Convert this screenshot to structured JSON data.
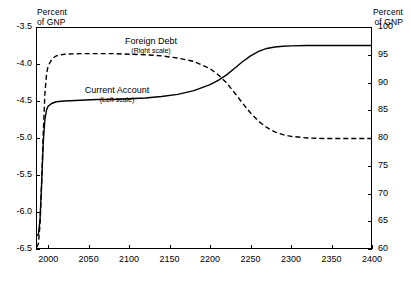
{
  "chart_data": {
    "type": "line",
    "title": "",
    "xlabel": "",
    "xlim": [
      1985,
      2400
    ],
    "grid": false,
    "legend_position": "inline-annotations",
    "xticks": [
      "2000",
      "2050",
      "2100",
      "2150",
      "2200",
      "2250",
      "2300",
      "2350",
      "2400"
    ],
    "xtick_values": [
      2000,
      2050,
      2100,
      2150,
      2200,
      2250,
      2300,
      2350,
      2400
    ],
    "left_axis": {
      "title": "Percent\nof GNP",
      "ylim": [
        -6.5,
        -3.5
      ],
      "ticks": [
        "-3.5",
        "-4.0",
        "-4.5",
        "-5.0",
        "-5.5",
        "-6.0",
        "-6.5"
      ],
      "tick_values": [
        -3.5,
        -4.0,
        -4.5,
        -5.0,
        -5.5,
        -6.0,
        -6.5
      ]
    },
    "right_axis": {
      "title": "Percent\nof GNP",
      "ylim": [
        60,
        100
      ],
      "ticks": [
        "100",
        "95",
        "90",
        "85",
        "80",
        "75",
        "70",
        "65",
        "60"
      ],
      "tick_values": [
        100,
        95,
        90,
        85,
        80,
        75,
        70,
        65,
        60
      ]
    },
    "series": [
      {
        "name": "Current Account",
        "scale_note": "(Left scale)",
        "axis": "left",
        "style": "solid",
        "color": "#000000",
        "x": [
          1986,
          1988,
          1990,
          1992,
          1994,
          1996,
          1998,
          2000,
          2005,
          2010,
          2020,
          2040,
          2060,
          2080,
          2100,
          2120,
          2140,
          2160,
          2180,
          2200,
          2210,
          2220,
          2230,
          2240,
          2250,
          2260,
          2270,
          2280,
          2290,
          2300,
          2320,
          2340,
          2360,
          2380,
          2400
        ],
        "y": [
          -6.32,
          -6.3,
          -6.1,
          -5.6,
          -5.05,
          -4.75,
          -4.62,
          -4.57,
          -4.53,
          -4.51,
          -4.5,
          -4.49,
          -4.48,
          -4.48,
          -4.47,
          -4.46,
          -4.44,
          -4.41,
          -4.36,
          -4.28,
          -4.22,
          -4.15,
          -4.06,
          -3.97,
          -3.89,
          -3.83,
          -3.79,
          -3.77,
          -3.76,
          -3.755,
          -3.75,
          -3.75,
          -3.75,
          -3.75,
          -3.75
        ]
      },
      {
        "name": "Foreign Debt",
        "scale_note": "(Right scale)",
        "axis": "right",
        "style": "dashed",
        "color": "#000000",
        "x": [
          1986,
          1988,
          1990,
          1992,
          1994,
          1996,
          1998,
          2000,
          2005,
          2010,
          2020,
          2040,
          2060,
          2080,
          2100,
          2120,
          2140,
          2160,
          2180,
          2200,
          2210,
          2220,
          2230,
          2240,
          2250,
          2260,
          2270,
          2280,
          2290,
          2300,
          2320,
          2340,
          2360,
          2380,
          2400
        ],
        "y": [
          60.3,
          61.0,
          64.5,
          72.0,
          81.0,
          88.0,
          91.5,
          93.0,
          94.3,
          94.8,
          95.1,
          95.2,
          95.2,
          95.2,
          95.1,
          95.0,
          94.8,
          94.4,
          93.8,
          92.5,
          91.4,
          90.0,
          88.2,
          86.3,
          84.5,
          83.0,
          81.9,
          81.1,
          80.6,
          80.3,
          80.0,
          79.9,
          79.9,
          79.9,
          79.9
        ]
      }
    ]
  }
}
